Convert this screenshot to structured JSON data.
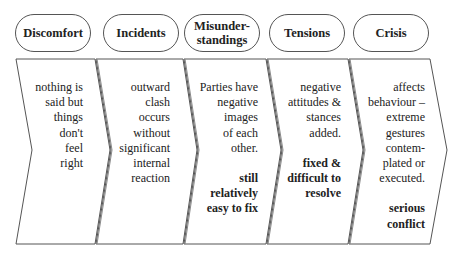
{
  "diagram": {
    "stages": [
      {
        "label": "Discomfort",
        "description": "nothing is said but things don't feel right",
        "lines": [
          "nothing is",
          "said but",
          "things",
          "don't",
          "feel",
          "right"
        ],
        "emphasis": ""
      },
      {
        "label": "Incidents",
        "description": "outward clash occurs without significant internal reaction",
        "lines": [
          "outward",
          "clash",
          "occurs",
          "without",
          "significant",
          "internal",
          "reaction"
        ],
        "emphasis": ""
      },
      {
        "label": "Misunder-standings",
        "label_lines": [
          "Misunder-",
          "standings"
        ],
        "description": "Parties have negative images of each other.",
        "lines": [
          "Parties have",
          "negative",
          "images",
          "of each",
          "other."
        ],
        "emphasis": "still relatively easy to fix",
        "emphasis_lines": [
          "still",
          "relatively",
          "easy to fix"
        ]
      },
      {
        "label": "Tensions",
        "description": "negative attitudes & stances added.",
        "lines": [
          "negative",
          "attitudes &",
          "stances",
          "added."
        ],
        "emphasis": "fixed & difficult to resolve",
        "emphasis_lines": [
          "fixed &",
          "difficult to",
          "resolve"
        ]
      },
      {
        "label": "Crisis",
        "description": "affects behaviour – extreme gestures contemplated or executed.",
        "lines": [
          "affects",
          "behaviour –",
          "extreme",
          "gestures",
          "contem-",
          "plated or",
          "executed."
        ],
        "emphasis": "serious conflict",
        "emphasis_lines": [
          "serious",
          "conflict"
        ]
      }
    ],
    "colors": {
      "stroke": "#555555",
      "background": "#ffffff",
      "text": "#222222"
    }
  }
}
